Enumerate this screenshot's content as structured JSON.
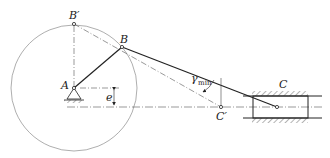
{
  "labels": {
    "A": "A",
    "B": "B",
    "B_prime": "B′",
    "C": "C",
    "C_prime": "C′",
    "e": "e",
    "gamma": "γ",
    "gamma_sub": "min"
  },
  "colors": {
    "line": "#222222",
    "thin": "#555555",
    "background": "#ffffff"
  }
}
